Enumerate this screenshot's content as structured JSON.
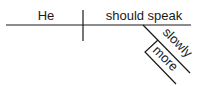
{
  "diagram": {
    "type": "sentence-diagram",
    "subject": "He",
    "predicate": "should speak",
    "modifiers": [
      {
        "word": "slowly",
        "modifies": "should speak"
      },
      {
        "word": "more",
        "modifies": "slowly"
      }
    ],
    "colors": {
      "line": "#1a1a1a",
      "text": "#1a1a1a",
      "background": "#ffffff"
    }
  }
}
